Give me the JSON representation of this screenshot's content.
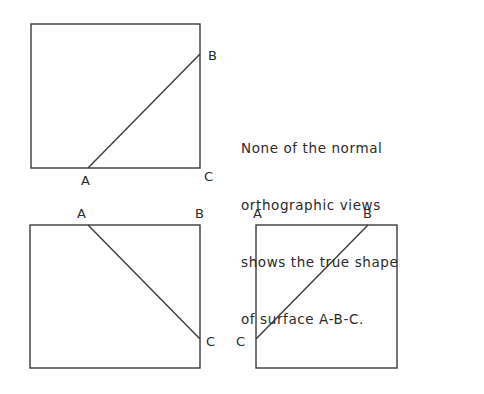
{
  "note": {
    "lines": [
      "None of the normal",
      "orthographic views",
      "shows the true shape",
      "of surface A-B-C."
    ]
  },
  "views": {
    "top": {
      "labels": {
        "A": "A",
        "B": "B",
        "C": "C"
      },
      "box": {
        "x": 31,
        "y": 24,
        "w": 169,
        "h": 144
      },
      "edge": {
        "from": "A",
        "to": "B"
      }
    },
    "front": {
      "labels": {
        "A": "A",
        "B": "B",
        "C": "C"
      },
      "box": {
        "x": 30,
        "y": 225,
        "w": 170,
        "h": 143
      },
      "edge": {
        "from": "A",
        "to": "C"
      }
    },
    "side": {
      "labels": {
        "A": "A",
        "B": "B",
        "C": "C"
      },
      "box": {
        "x": 256,
        "y": 225,
        "w": 141,
        "h": 143
      },
      "edge": {
        "from": "C",
        "to": "B"
      }
    }
  },
  "colors": {
    "line": "#3a3a3a",
    "text": "#2a2a2a",
    "background": "#ffffff"
  }
}
